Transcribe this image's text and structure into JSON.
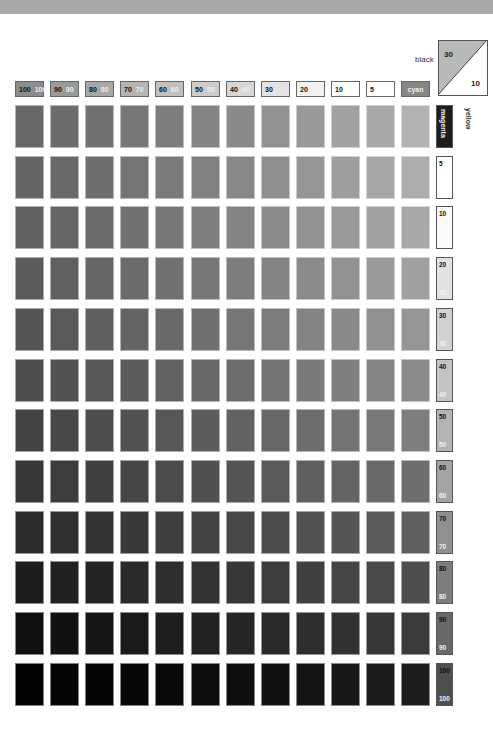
{
  "chart_data": {
    "type": "heatmap",
    "fixed": {
      "black": 30,
      "yellow": 10
    },
    "x_axis": {
      "label": "cyan",
      "categories": [
        100,
        90,
        80,
        70,
        60,
        50,
        40,
        30,
        20,
        10,
        5,
        0
      ]
    },
    "y_axis": {
      "label": "magenta",
      "categories": [
        0,
        5,
        10,
        20,
        30,
        40,
        50,
        60,
        70,
        80,
        90,
        100
      ]
    },
    "header_labels": [
      "100",
      "90",
      "80",
      "70",
      "60",
      "50",
      "40",
      "30",
      "20",
      "10",
      "5",
      "cyan"
    ],
    "row_labels": [
      "magenta",
      "5",
      "10",
      "20",
      "30",
      "40",
      "50",
      "60",
      "70",
      "80",
      "90",
      "100"
    ],
    "gray_rows": [
      [
        "#676767",
        "#6c6c6c",
        "#717171",
        "#777777",
        "#7d7d7d",
        "#848484",
        "#8a8a8a",
        "#929292",
        "#999999",
        "#a1a1a1",
        "#a9a9a9",
        "#b2b2b2"
      ],
      [
        "#646464",
        "#696969",
        "#6e6e6e",
        "#747474",
        "#7a7a7a",
        "#818181",
        "#878787",
        "#8f8f8f",
        "#969696",
        "#9e9e9e",
        "#a6a6a6",
        "#adadad"
      ],
      [
        "#616161",
        "#666666",
        "#6b6b6b",
        "#717171",
        "#777777",
        "#7e7e7e",
        "#848484",
        "#8b8b8b",
        "#929292",
        "#9a9a9a",
        "#a2a2a2",
        "#a9a9a9"
      ],
      [
        "#5b5b5b",
        "#606060",
        "#656565",
        "#6b6b6b",
        "#717171",
        "#777777",
        "#7d7d7d",
        "#848484",
        "#8b8b8b",
        "#929292",
        "#9a9a9a",
        "#a0a0a0"
      ],
      [
        "#555555",
        "#5a5a5a",
        "#5f5f5f",
        "#646464",
        "#6a6a6a",
        "#707070",
        "#767676",
        "#7c7c7c",
        "#838383",
        "#898989",
        "#909090",
        "#969696"
      ],
      [
        "#4d4d4d",
        "#525252",
        "#575757",
        "#5c5c5c",
        "#626262",
        "#676767",
        "#6d6d6d",
        "#737373",
        "#797979",
        "#7f7f7f",
        "#858585",
        "#8b8b8b"
      ],
      [
        "#434343",
        "#484848",
        "#4d4d4d",
        "#525252",
        "#575757",
        "#5c5c5c",
        "#626262",
        "#676767",
        "#6d6d6d",
        "#737373",
        "#787878",
        "#7e7e7e"
      ],
      [
        "#373737",
        "#3c3c3c",
        "#414141",
        "#464646",
        "#4b4b4b",
        "#505050",
        "#555555",
        "#5a5a5a",
        "#5f5f5f",
        "#646464",
        "#696969",
        "#6e6e6e"
      ],
      [
        "#2b2b2b",
        "#303030",
        "#343434",
        "#393939",
        "#3d3d3d",
        "#424242",
        "#474747",
        "#4c4c4c",
        "#515151",
        "#555555",
        "#5a5a5a",
        "#5f5f5f"
      ],
      [
        "#1d1d1d",
        "#212121",
        "#252525",
        "#2a2a2a",
        "#2e2e2e",
        "#333333",
        "#373737",
        "#3c3c3c",
        "#404040",
        "#454545",
        "#494949",
        "#4e4e4e"
      ],
      [
        "#0f0f0f",
        "#121212",
        "#161616",
        "#1a1a1a",
        "#1e1e1e",
        "#222222",
        "#262626",
        "#2a2a2a",
        "#2e2e2e",
        "#323232",
        "#363636",
        "#3a3a3a"
      ],
      [
        "#030303",
        "#040404",
        "#050505",
        "#070707",
        "#090909",
        "#0b0b0b",
        "#0e0e0e",
        "#111111",
        "#141414",
        "#171717",
        "#1a1a1a",
        "#1d1d1d"
      ]
    ],
    "header_fills": [
      "#8c8c8c",
      "#9a9a9a",
      "#a7a7a7",
      "#b4b4b4",
      "#c0c0c0",
      "#cccccc",
      "#d7d7d7",
      "#e3e3e3",
      "#f2f2f2",
      "#ffffff",
      "#ffffff",
      "#858585"
    ],
    "row_label_fills": [
      "#1e1e1e",
      "#ffffff",
      "#fafafa",
      "#e2e2e2",
      "#d2d2d2",
      "#c4c4c4",
      "#b4b4b4",
      "#a3a3a3",
      "#919191",
      "#7d7d7d",
      "#686868",
      "#4f4f4f"
    ]
  },
  "legend": {
    "black_label": "black",
    "black_value": "30",
    "yellow_value": "10",
    "yellow_label": "yellow"
  }
}
